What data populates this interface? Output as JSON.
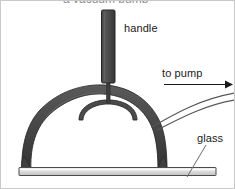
{
  "figure": {
    "width": 235,
    "height": 189,
    "background": "#ffffff",
    "border_color": "#c9c9c9"
  },
  "labels": {
    "handle": "handle",
    "to_pump": "to pump",
    "glass": "glass",
    "cut_off_top_text": "a vacuum pump"
  },
  "colors": {
    "ink": "#1a1a1a",
    "dome_dark": "#474747",
    "dome_edge": "#2b2b2b",
    "handle_fill": "#4d4d4d",
    "handle_edge": "#2e2e2e",
    "plate_fill": "#d6d6d6",
    "plate_top": "#efefef",
    "plate_edge": "#4a4a4a",
    "tube_line": "#555555",
    "leader_line": "#6a6a6a",
    "arrow": "#1a1a1a"
  },
  "parts": {
    "handle": {
      "name": "handle",
      "shape": "vertical rounded bar",
      "x": 101,
      "y": 9,
      "width": 13,
      "height": 73
    },
    "stem": {
      "name": "stem rod",
      "shape": "thin vertical rod",
      "x": 106,
      "y": 82,
      "width": 3,
      "height": 20
    },
    "inner_arch": {
      "name": "inner stopper arch",
      "shape": "small semicircular arc",
      "cx": 107,
      "cy": 117,
      "rx": 30,
      "ry": 17
    },
    "dome": {
      "name": "glass bell jar dome",
      "shape": "thick semicircular arc with flared feet",
      "cx": 90,
      "base_y": 168,
      "rx": 74,
      "ry": 58,
      "thickness": 8
    },
    "plate": {
      "name": "base plate",
      "shape": "flat horizontal slab",
      "x": 18,
      "y": 166,
      "width": 197,
      "height": 8
    },
    "tube": {
      "name": "outlet tube to pump",
      "shape": "two curving parallel lines going up to the right",
      "from_x": 152,
      "from_y": 124,
      "to_x": 233,
      "to_y": 88
    },
    "arrow": {
      "name": "flow direction arrow",
      "shape": "horizontal arrow pointing right",
      "x1": 163,
      "x2": 227,
      "y": 83
    },
    "glass_leader": {
      "name": "leader line to glass wall",
      "shape": "thin diagonal line",
      "x1": 204,
      "y1": 145,
      "x2": 186,
      "y2": 176
    }
  }
}
